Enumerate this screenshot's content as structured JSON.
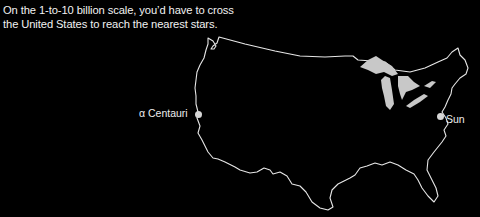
{
  "caption": {
    "line1": "On the 1-to-10 billion scale, you’d have to cross",
    "line2": "the United States to reach the nearest stars."
  },
  "map": {
    "subject": "outline map of the contiguous United States",
    "outline_color": "#e6e6e6",
    "lakes_color": "#c8c8c8",
    "background": "#000000"
  },
  "markers": [
    {
      "name": "alpha-centauri",
      "label": "α Centauri",
      "location": "California coast",
      "color": "#d6d6d6"
    },
    {
      "name": "sun",
      "label": "Sun",
      "location": "Washington, D.C. / Chesapeake area",
      "color": "#d6d6d6"
    }
  ]
}
